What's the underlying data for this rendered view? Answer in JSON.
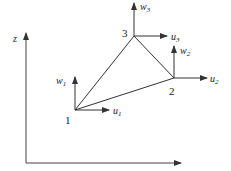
{
  "diagram": {
    "axes": {
      "vertical_label": "z",
      "horizontal_label": ""
    },
    "nodes": [
      {
        "id": "1",
        "x": 75,
        "y": 110,
        "u_label": "u",
        "u_sub": "1",
        "w_label": "w",
        "w_sub": "1"
      },
      {
        "id": "2",
        "x": 174,
        "y": 78,
        "u_label": "u",
        "u_sub": "2",
        "w_label": "w",
        "w_sub": "2"
      },
      {
        "id": "3",
        "x": 134,
        "y": 36,
        "u_label": "u",
        "u_sub": "3",
        "w_label": "w",
        "w_sub": "3"
      }
    ],
    "element": "triangle 1-2-3",
    "colors": {
      "line": "#333333",
      "background": "#ffffff"
    }
  }
}
